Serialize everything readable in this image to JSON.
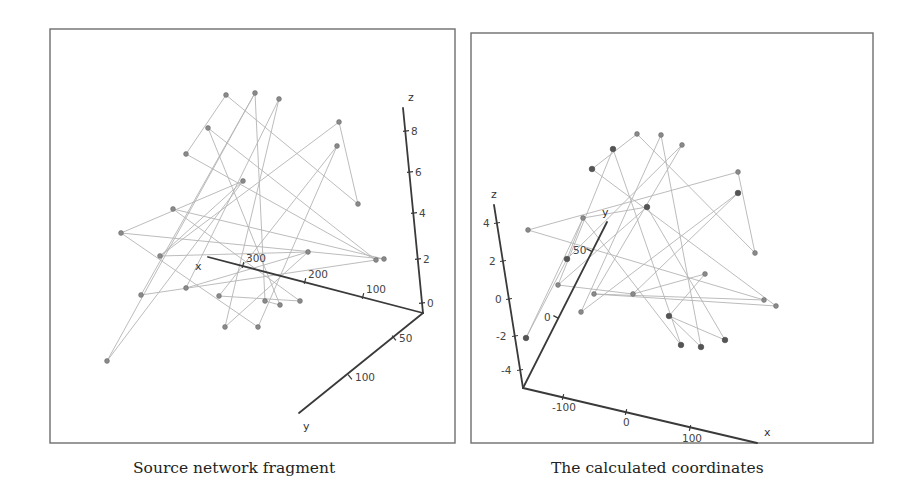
{
  "captions": {
    "left": "Source network fragment",
    "right": "The calculated coordinates"
  },
  "colors": {
    "frame": "#6e6e6e",
    "edge": "#b4b4b4",
    "axis": "#3a3a3a",
    "node": "#8a8a8a"
  },
  "panels": [
    {
      "id": "source",
      "frame": {
        "x": 50,
        "y": 29,
        "w": 405,
        "h": 414
      },
      "axes": [
        {
          "name": "z",
          "from": [
            423,
            313
          ],
          "to": [
            403,
            108
          ],
          "label": "z",
          "label_pos": [
            408,
            101
          ],
          "ticks": [
            {
              "label": "8",
              "pos": [
                406,
                131
              ],
              "dx": 5,
              "dy": 4
            },
            {
              "label": "6",
              "pos": [
                410,
                172
              ],
              "dx": 5,
              "dy": 4
            },
            {
              "label": "4",
              "pos": [
                414,
                213
              ],
              "dx": 5,
              "dy": 4
            },
            {
              "label": "2",
              "pos": [
                418,
                259
              ],
              "dx": 5,
              "dy": 4
            },
            {
              "label": "0",
              "pos": [
                422,
                303
              ],
              "dx": 5,
              "dy": 4
            }
          ]
        },
        {
          "name": "x",
          "from": [
            423,
            313
          ],
          "to": [
            208,
            257
          ],
          "label": "x",
          "label_pos": [
            195,
            270
          ],
          "ticks": [
            {
              "label": "300",
              "pos": [
                243,
                265
              ],
              "dx": 3,
              "dy": -3
            },
            {
              "label": "200",
              "pos": [
                305,
                281
              ],
              "dx": 3,
              "dy": -3
            },
            {
              "label": "100",
              "pos": [
                363,
                296
              ],
              "dx": 3,
              "dy": -3
            }
          ]
        },
        {
          "name": "y",
          "from": [
            423,
            313
          ],
          "to": [
            299,
            413
          ],
          "label": "y",
          "label_pos": [
            303,
            430
          ],
          "ticks": [
            {
              "label": "50",
              "pos": [
                394,
                338
              ],
              "dx": 5,
              "dy": 4
            },
            {
              "label": "100",
              "pos": [
                350,
                377
              ],
              "dx": 5,
              "dy": 4
            }
          ]
        }
      ],
      "nodes": [
        [
          226,
          95
        ],
        [
          255,
          93
        ],
        [
          279,
          99
        ],
        [
          208,
          128
        ],
        [
          186,
          154
        ],
        [
          339,
          122
        ],
        [
          337,
          146
        ],
        [
          243,
          181
        ],
        [
          358,
          204
        ],
        [
          173,
          209
        ],
        [
          121,
          233
        ],
        [
          160,
          256
        ],
        [
          141,
          295
        ],
        [
          186,
          288
        ],
        [
          219,
          296
        ],
        [
          308,
          252
        ],
        [
          376,
          260
        ],
        [
          384,
          259
        ],
        [
          258,
          327
        ],
        [
          225,
          327
        ],
        [
          265,
          301
        ],
        [
          280,
          305
        ],
        [
          300,
          301
        ],
        [
          107,
          361
        ]
      ],
      "edges": [
        [
          0,
          4
        ],
        [
          0,
          8
        ],
        [
          1,
          12
        ],
        [
          1,
          23
        ],
        [
          1,
          20
        ],
        [
          2,
          13
        ],
        [
          3,
          24
        ],
        [
          3,
          21
        ],
        [
          4,
          16
        ],
        [
          5,
          11
        ],
        [
          5,
          8
        ],
        [
          6,
          18
        ],
        [
          6,
          14
        ],
        [
          7,
          10
        ],
        [
          7,
          23
        ],
        [
          9,
          22
        ],
        [
          9,
          17
        ],
        [
          10,
          17
        ],
        [
          11,
          15
        ],
        [
          12,
          16
        ],
        [
          13,
          15
        ],
        [
          14,
          22
        ],
        [
          19,
          15
        ],
        [
          20,
          21
        ],
        [
          2,
          19
        ],
        [
          3,
          16
        ],
        [
          10,
          18
        ],
        [
          7,
          11
        ]
      ]
    },
    {
      "id": "calculated",
      "frame": {
        "x": 471,
        "y": 33,
        "w": 402,
        "h": 410
      },
      "axes": [
        {
          "name": "z",
          "from": [
            523,
            388
          ],
          "to": [
            494,
            205
          ],
          "label": "z",
          "label_pos": [
            491,
            198
          ],
          "ticks": [
            {
              "label": "4",
              "pos": [
                497,
                223
              ],
              "dx": -14,
              "dy": 4
            },
            {
              "label": "2",
              "pos": [
                503,
                261
              ],
              "dx": -14,
              "dy": 4
            },
            {
              "label": "0",
              "pos": [
                509,
                299
              ],
              "dx": -14,
              "dy": 4
            },
            {
              "label": "-2",
              "pos": [
                515,
                336
              ],
              "dx": -19,
              "dy": 4
            },
            {
              "label": "-4",
              "pos": [
                520,
                370
              ],
              "dx": -19,
              "dy": 4
            }
          ]
        },
        {
          "name": "y",
          "from": [
            523,
            388
          ],
          "to": [
            607,
            222
          ],
          "label": "y",
          "label_pos": [
            602,
            216
          ],
          "ticks": [
            {
              "label": "50",
              "pos": [
                589,
                250
              ],
              "dx": -16,
              "dy": 4
            },
            {
              "label": "0",
              "pos": [
                556,
                317
              ],
              "dx": -12,
              "dy": 4
            }
          ]
        },
        {
          "name": "x",
          "from": [
            523,
            388
          ],
          "to": [
            757,
            443
          ],
          "label": "x",
          "label_pos": [
            764,
            436
          ],
          "ticks": [
            {
              "label": "-100",
              "pos": [
                563,
                397
              ],
              "dx": -11,
              "dy": 14
            },
            {
              "label": "0",
              "pos": [
                626,
                412
              ],
              "dx": -3,
              "dy": 14
            },
            {
              "label": "100",
              "pos": [
                690,
                428
              ],
              "dx": -8,
              "dy": 14
            }
          ]
        }
      ],
      "nodes": [
        [
          637,
          134
        ],
        [
          661,
          135
        ],
        [
          613,
          149
        ],
        [
          682,
          145
        ],
        [
          592,
          169
        ],
        [
          738,
          172
        ],
        [
          738,
          193
        ],
        [
          647,
          207
        ],
        [
          583,
          218
        ],
        [
          528,
          230
        ],
        [
          755,
          253
        ],
        [
          567,
          259
        ],
        [
          558,
          285
        ],
        [
          594,
          294
        ],
        [
          633,
          294
        ],
        [
          705,
          274
        ],
        [
          764,
          300
        ],
        [
          776,
          306
        ],
        [
          581,
          312
        ],
        [
          669,
          316
        ],
        [
          681,
          345
        ],
        [
          701,
          347
        ],
        [
          725,
          340
        ],
        [
          526,
          338
        ]
      ],
      "dark_nodes": [
        2,
        4,
        6,
        7,
        11,
        19,
        20,
        21,
        22,
        23
      ],
      "edges": [
        [
          0,
          4
        ],
        [
          0,
          10
        ],
        [
          1,
          18
        ],
        [
          1,
          21
        ],
        [
          2,
          12
        ],
        [
          3,
          13
        ],
        [
          2,
          20
        ],
        [
          4,
          17
        ],
        [
          5,
          9
        ],
        [
          5,
          10
        ],
        [
          6,
          14
        ],
        [
          6,
          18
        ],
        [
          7,
          8
        ],
        [
          7,
          22
        ],
        [
          8,
          20
        ],
        [
          8,
          23
        ],
        [
          9,
          16
        ],
        [
          11,
          23
        ],
        [
          12,
          14
        ],
        [
          13,
          16
        ],
        [
          14,
          15
        ],
        [
          15,
          19
        ],
        [
          19,
          22
        ],
        [
          3,
          11
        ],
        [
          12,
          7
        ],
        [
          13,
          17
        ],
        [
          19,
          21
        ],
        [
          11,
          8
        ]
      ]
    }
  ]
}
